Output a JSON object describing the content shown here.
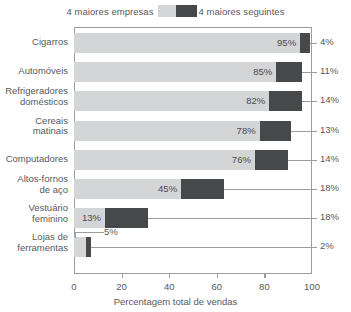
{
  "legend": {
    "left_label": "4 maiores empresas",
    "right_label": "4 maiores seguintes",
    "light_swatch_name": "light-gray-swatch",
    "dark_swatch_name": "dark-gray-swatch",
    "light_color": "#d4d5d7",
    "dark_color": "#47484a"
  },
  "axis": {
    "x_title": "Percentagem total de vendas",
    "x_ticks": [
      "0",
      "20",
      "40",
      "60",
      "80",
      "100"
    ],
    "x_tick_values": [
      0,
      20,
      40,
      60,
      80,
      100
    ]
  },
  "chart_data": {
    "type": "bar",
    "orientation": "horizontal",
    "stacked": true,
    "title": "",
    "xlabel": "Percentagem total de vendas",
    "ylabel": "",
    "xlim": [
      0,
      100
    ],
    "grid": false,
    "legend_position": "top-center",
    "categories": [
      "Cigarros",
      "Automóveis",
      "Refrigeradores domésticos",
      "Cereais matinais",
      "Computadores",
      "Altos-fornos de aço",
      "Vestuário feminino",
      "Lojas de ferramentas"
    ],
    "series": [
      {
        "name": "4 maiores empresas",
        "color": "#d4d5d7",
        "values": [
          95,
          85,
          82,
          78,
          76,
          45,
          13,
          5
        ]
      },
      {
        "name": "4 maiores seguintes",
        "color": "#47484a",
        "values": [
          4,
          11,
          14,
          13,
          14,
          18,
          18,
          2
        ]
      }
    ]
  },
  "rows": [
    {
      "label": "Cigarros",
      "label_lines": "Cigarros",
      "light_value": 95,
      "dark_value": 4,
      "light_text": "95%",
      "dark_text": "4%",
      "light_text_inside": true
    },
    {
      "label": "Automóveis",
      "label_lines": "Automóveis",
      "light_value": 85,
      "dark_value": 11,
      "light_text": "85%",
      "dark_text": "11%",
      "light_text_inside": true
    },
    {
      "label": "Refrigeradores domésticos",
      "label_lines": "Refrigeradores\ndomésticos",
      "light_value": 82,
      "dark_value": 14,
      "light_text": "82%",
      "dark_text": "14%",
      "light_text_inside": true
    },
    {
      "label": "Cereais matinais",
      "label_lines": "Cereais\nmatinais",
      "light_value": 78,
      "dark_value": 13,
      "light_text": "78%",
      "dark_text": "13%",
      "light_text_inside": true
    },
    {
      "label": "Computadores",
      "label_lines": "Computadores",
      "light_value": 76,
      "dark_value": 14,
      "light_text": "76%",
      "dark_text": "14%",
      "light_text_inside": true
    },
    {
      "label": "Altos-fornos de aço",
      "label_lines": "Altos-fornos\nde aço",
      "light_value": 45,
      "dark_value": 18,
      "light_text": "45%",
      "dark_text": "18%",
      "light_text_inside": true
    },
    {
      "label": "Vestuário feminino",
      "label_lines": "Vestuário\nfeminino",
      "light_value": 13,
      "dark_value": 18,
      "light_text": "13%",
      "dark_text": "18%",
      "light_text_inside": true
    },
    {
      "label": "Lojas de ferramentas",
      "label_lines": "Lojas de\nferramentas",
      "light_value": 5,
      "dark_value": 2,
      "light_text": "5%",
      "dark_text": "2%",
      "light_text_inside": false
    }
  ]
}
